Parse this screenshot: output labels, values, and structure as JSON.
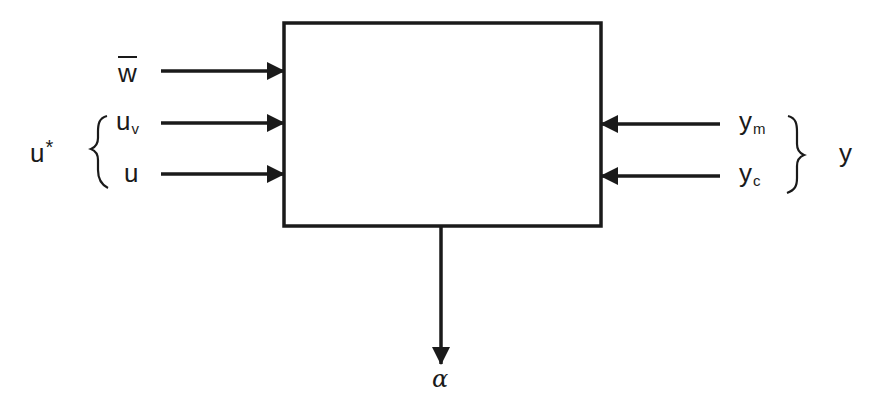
{
  "diagram": {
    "block": {
      "label": ""
    },
    "inputs_left": [
      {
        "id": "w_bar",
        "text": "w",
        "overline": true
      },
      {
        "id": "u_v",
        "text": "u",
        "subscript": "v"
      },
      {
        "id": "u",
        "text": "u"
      }
    ],
    "group_left": {
      "text": "u",
      "superscript": "*",
      "members": [
        "u_v",
        "u"
      ]
    },
    "inputs_right": [
      {
        "id": "y_m",
        "text": "y",
        "subscript": "m"
      },
      {
        "id": "y_c",
        "text": "y",
        "subscript": "c"
      }
    ],
    "group_right": {
      "text": "y",
      "members": [
        "y_m",
        "y_c"
      ]
    },
    "output_bottom": {
      "id": "alpha",
      "text": "α"
    },
    "colors": {
      "stroke": "#1a1a1a",
      "background": "#ffffff"
    }
  }
}
